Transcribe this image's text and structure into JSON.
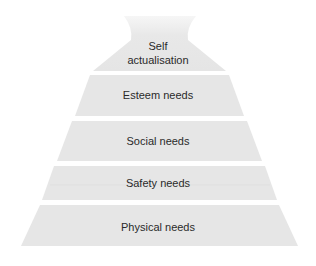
{
  "diagram": {
    "type": "pyramid",
    "fill_color": "#e6e6e6",
    "top_fill_color": "#eeeeee",
    "text_color": "#2a2a2a",
    "tiers": [
      {
        "label_line1": "Self",
        "label_line2": "actualisation"
      },
      {
        "label": "Esteem needs"
      },
      {
        "label": "Social needs"
      },
      {
        "label": "Safety needs"
      },
      {
        "label": "Physical needs"
      }
    ]
  }
}
